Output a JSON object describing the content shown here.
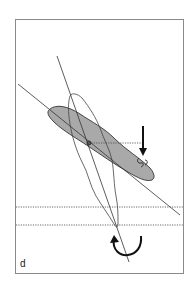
{
  "figure": {
    "panel_label": "d",
    "elements": [
      "shaded-elongated-region",
      "outline-loop-region",
      "primary-diagonal-axis",
      "secondary-steep-axis",
      "dotted-horizontal-reference-line-upper",
      "dotted-horizontal-reference-line-lower",
      "dotted-connector-line",
      "downward-arrow",
      "curved-rotation-arrow",
      "pivot-point"
    ],
    "colors": {
      "frame": "#888888",
      "shade": "#aaaaaa",
      "line": "#333333",
      "arrow": "#111111"
    }
  }
}
